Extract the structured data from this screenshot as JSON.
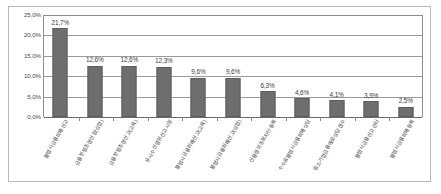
{
  "chart_data": {
    "type": "bar",
    "title": "",
    "xlabel": "",
    "ylabel": "",
    "ylim": [
      0,
      25
    ],
    "grid": true,
    "legend": "none",
    "decimal_separator": ",",
    "value_suffix": "%",
    "ytick_labels": [
      "25,0%",
      "20,0%",
      "15,0%",
      "10,0%",
      "5,0%",
      "0,0%"
    ],
    "ytick_values": [
      25.0,
      20.0,
      15.0,
      10.0,
      5.0,
      0.0
    ],
    "categories": [
      "불법사금융피해신고",
      "금융분쟁조정신청(상업)",
      "금융분쟁조정신고(교육)",
      "유사수신행위신고사항",
      "불법사금융피해신고(교육)",
      "불법사금융피해신고(상업)",
      "신용정보조회차단등록",
      "수수료불법사금융피해상담",
      "중소기업금융애로상담접수",
      "불법사금융신고센터",
      "불법사금융피해등록"
    ],
    "values": [
      21.7,
      12.6,
      12.6,
      12.3,
      9.6,
      9.6,
      6.3,
      4.6,
      4.1,
      3.9,
      2.5
    ],
    "value_labels": [
      "21,7%",
      "12,6%",
      "12,6%",
      "12,3%",
      "9,6%",
      "9,6%",
      "6,3%",
      "4,6%",
      "4,1%",
      "3,9%",
      "2,5%"
    ],
    "bar_color": "#6e6e6e",
    "grid_color": "#9a9a9a",
    "frame_color": "#b9b9b9",
    "background": "#ffffff"
  }
}
